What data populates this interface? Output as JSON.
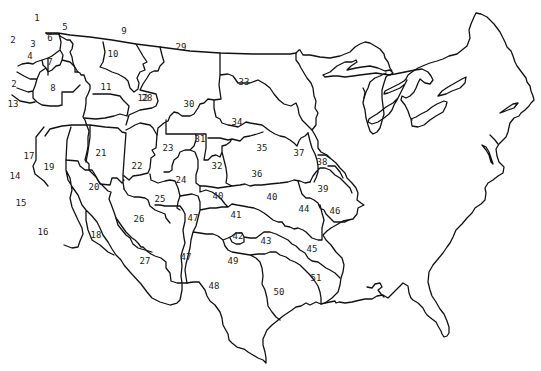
{
  "map": {
    "title": "Western and Central United States numbered regions",
    "line_color": "#111111",
    "background": "#ffffff",
    "regions": [
      {
        "id": "1",
        "x": 37,
        "y": 18
      },
      {
        "id": "2",
        "x": 13,
        "y": 40
      },
      {
        "id": "3",
        "x": 33,
        "y": 44
      },
      {
        "id": "4",
        "x": 30,
        "y": 56
      },
      {
        "id": "5",
        "x": 65,
        "y": 27
      },
      {
        "id": "6",
        "x": 50,
        "y": 38
      },
      {
        "id": "7",
        "x": 50,
        "y": 62
      },
      {
        "id": "8",
        "x": 53,
        "y": 88
      },
      {
        "id": "9",
        "x": 124,
        "y": 31
      },
      {
        "id": "10",
        "x": 113,
        "y": 54
      },
      {
        "id": "11",
        "x": 106,
        "y": 87
      },
      {
        "id": "12",
        "x": 143,
        "y": 98
      },
      {
        "id": "13",
        "x": 13,
        "y": 104
      },
      {
        "id": "2",
        "x": 14,
        "y": 84
      },
      {
        "id": "14",
        "x": 15,
        "y": 176
      },
      {
        "id": "15",
        "x": 21,
        "y": 203
      },
      {
        "id": "16",
        "x": 43,
        "y": 232
      },
      {
        "id": "17",
        "x": 29,
        "y": 156
      },
      {
        "id": "18",
        "x": 96,
        "y": 235
      },
      {
        "id": "19",
        "x": 49,
        "y": 167
      },
      {
        "id": "20",
        "x": 94,
        "y": 187
      },
      {
        "id": "21",
        "x": 101,
        "y": 153
      },
      {
        "id": "22",
        "x": 137,
        "y": 166
      },
      {
        "id": "23",
        "x": 168,
        "y": 148
      },
      {
        "id": "24",
        "x": 181,
        "y": 180
      },
      {
        "id": "25",
        "x": 160,
        "y": 199
      },
      {
        "id": "26",
        "x": 139,
        "y": 219
      },
      {
        "id": "27",
        "x": 145,
        "y": 261
      },
      {
        "id": "28",
        "x": 147,
        "y": 98
      },
      {
        "id": "29",
        "x": 181,
        "y": 47
      },
      {
        "id": "30",
        "x": 189,
        "y": 104
      },
      {
        "id": "31",
        "x": 200,
        "y": 139
      },
      {
        "id": "32",
        "x": 217,
        "y": 166
      },
      {
        "id": "33",
        "x": 244,
        "y": 82
      },
      {
        "id": "34",
        "x": 237,
        "y": 122
      },
      {
        "id": "35",
        "x": 262,
        "y": 148
      },
      {
        "id": "36",
        "x": 257,
        "y": 174
      },
      {
        "id": "37",
        "x": 299,
        "y": 153
      },
      {
        "id": "38",
        "x": 322,
        "y": 162
      },
      {
        "id": "39",
        "x": 323,
        "y": 189
      },
      {
        "id": "40",
        "x": 218,
        "y": 196
      },
      {
        "id": "40",
        "x": 272,
        "y": 197
      },
      {
        "id": "41",
        "x": 236,
        "y": 215
      },
      {
        "id": "42",
        "x": 238,
        "y": 236
      },
      {
        "id": "43",
        "x": 266,
        "y": 241
      },
      {
        "id": "44",
        "x": 304,
        "y": 209
      },
      {
        "id": "45",
        "x": 312,
        "y": 249
      },
      {
        "id": "46",
        "x": 335,
        "y": 211
      },
      {
        "id": "47",
        "x": 193,
        "y": 218
      },
      {
        "id": "47",
        "x": 186,
        "y": 257
      },
      {
        "id": "48",
        "x": 214,
        "y": 286
      },
      {
        "id": "49",
        "x": 233,
        "y": 261
      },
      {
        "id": "50",
        "x": 279,
        "y": 292
      },
      {
        "id": "51",
        "x": 316,
        "y": 278
      }
    ]
  }
}
